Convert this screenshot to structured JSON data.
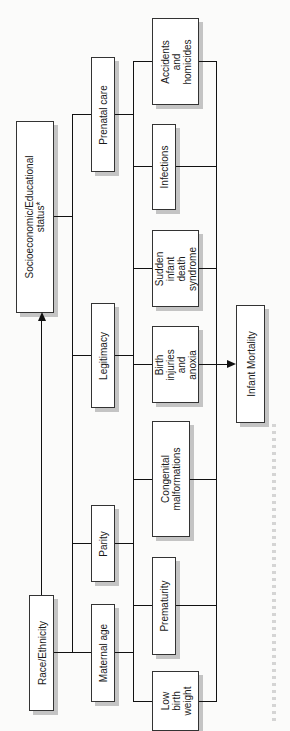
{
  "diagram": {
    "orientation": "rotated-90-ccw",
    "root_factors": [
      {
        "id": "socio",
        "label": "Socioeconomic/Educational\nstatus*"
      },
      {
        "id": "race",
        "label": "Race/Ethnicity"
      }
    ],
    "intermediate_factors": [
      {
        "id": "prenatal",
        "label": "Prenatal care"
      },
      {
        "id": "legitimacy",
        "label": "Legitimacy"
      },
      {
        "id": "parity",
        "label": "Parity"
      },
      {
        "id": "maternal",
        "label": "Maternal age"
      }
    ],
    "causes": [
      {
        "id": "accidents",
        "label": "Accidents\nand\nhomicides"
      },
      {
        "id": "infections",
        "label": "Infections"
      },
      {
        "id": "sids",
        "label": "Sudden\ninfant\ndeath\nsyndrome"
      },
      {
        "id": "birth",
        "label": "Birth\ninjuries\nand\nanoxia"
      },
      {
        "id": "congenital",
        "label": "Congenital\nmalformations"
      },
      {
        "id": "prematurity",
        "label": "Prematurity"
      },
      {
        "id": "lbw",
        "label": "Low\nbirth\nweight"
      }
    ],
    "outcome": {
      "id": "mortality",
      "label": "Infant Mortality"
    },
    "edges": [
      {
        "from": "race",
        "to": "socio",
        "type": "arrow"
      },
      {
        "from": "socio",
        "to": "intermediate_factors",
        "type": "bracket"
      },
      {
        "from": "race",
        "to": "intermediate_factors",
        "type": "bracket"
      },
      {
        "from": "intermediate_factors",
        "to": "causes",
        "type": "bracket"
      },
      {
        "from": "causes",
        "to": "mortality",
        "type": "arrow"
      }
    ],
    "footnote": "(illegible rotated footnote text)"
  }
}
